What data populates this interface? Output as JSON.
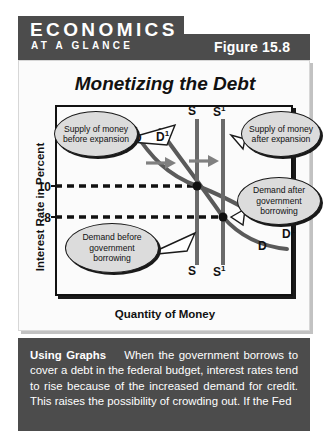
{
  "header": {
    "brand_line1": "ECONOMICS",
    "brand_line2": "AT A GLANCE",
    "figure_number": "Figure 15.8"
  },
  "figure": {
    "title": "Monetizing the Debt",
    "y_axis_label": "Interest Rate in Percent",
    "x_axis_label": "Quantity of Money",
    "y_ticks": [
      "10",
      "8"
    ],
    "curve_labels": {
      "supply_before": "S",
      "supply_after": "S1",
      "supply_before_bottom": "S",
      "supply_after_bottom": "S1",
      "demand_before_top": "D",
      "demand_after_top": "D1",
      "demand_before_right": "D",
      "demand_after_right": "D1"
    },
    "callouts": [
      {
        "id": "supply-before",
        "text": "Supply of money before expansion"
      },
      {
        "id": "supply-after",
        "text": "Supply of money after expansion"
      },
      {
        "id": "demand-after",
        "text": "Demand after government borrowing"
      },
      {
        "id": "demand-before",
        "text": "Demand before government borrowing"
      }
    ]
  },
  "chart_data": {
    "type": "line",
    "title": "Monetizing the Debt",
    "xlabel": "Quantity of Money",
    "ylabel": "Interest Rate in Percent",
    "ylim": [
      0,
      16
    ],
    "xlim": [
      0,
      10
    ],
    "grid": false,
    "y_tick_values": [
      10,
      8
    ],
    "y_tick_labels": [
      "10",
      "8"
    ],
    "legend_position": "inline-callouts",
    "series": [
      {
        "name": "S",
        "description": "Supply of money before expansion (vertical)",
        "type": "vertical-line",
        "x": 5.6,
        "label": "S"
      },
      {
        "name": "S1",
        "description": "Supply of money after expansion (vertical, shifted right)",
        "type": "vertical-line",
        "x": 6.9,
        "label": "S1"
      },
      {
        "name": "D",
        "description": "Demand before government borrowing (downward sloping)",
        "type": "curve",
        "label": "D",
        "points": [
          [
            3.3,
            14.2
          ],
          [
            4.0,
            12.2
          ],
          [
            4.8,
            10.8
          ],
          [
            5.6,
            10.0
          ],
          [
            6.6,
            8.4
          ],
          [
            7.8,
            7.3
          ],
          [
            8.6,
            6.9
          ]
        ]
      },
      {
        "name": "D1",
        "description": "Demand after government borrowing (shifted right)",
        "type": "curve",
        "label": "D1",
        "points": [
          [
            4.5,
            14.2
          ],
          [
            5.2,
            12.2
          ],
          [
            6.0,
            10.3
          ],
          [
            6.9,
            8.0
          ],
          [
            8.0,
            7.3
          ],
          [
            9.2,
            6.9
          ],
          [
            9.8,
            6.8
          ]
        ]
      }
    ],
    "equilibria": [
      {
        "label": "D x S",
        "x": 5.6,
        "y": 10
      },
      {
        "label": "D1 x S1",
        "x": 6.9,
        "y": 8
      }
    ],
    "annotations": [
      {
        "text": "Supply of money before expansion",
        "points_to": "S"
      },
      {
        "text": "Supply of money after expansion",
        "points_to": "S1"
      },
      {
        "text": "Demand before government borrowing",
        "points_to": "D"
      },
      {
        "text": "Demand after government borrowing",
        "points_to": "D1"
      },
      {
        "text": "shift arrow",
        "type": "arrow",
        "from": "D",
        "to": "D1"
      },
      {
        "text": "shift arrow",
        "type": "arrow",
        "from": "S",
        "to": "S1"
      }
    ]
  },
  "caption": {
    "lead": "Using Graphs",
    "body": "When the government borrows to cover a debt in the federal budget, interest rates tend to rise because of the increased demand for credit. This raises the possibility of crowding out. If the Fed"
  },
  "colors": {
    "banner": "#4c4c4c",
    "panel": "#fbfbfb",
    "bubble_fill": "#dcdcdc",
    "ink": "#111111",
    "curve": "#555555",
    "arrow": "#777777"
  }
}
